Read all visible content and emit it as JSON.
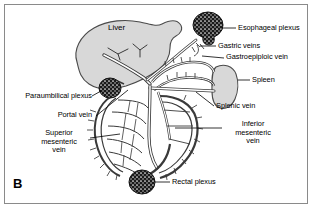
{
  "figure": {
    "panel_letter": "B",
    "type": "anatomical-diagram",
    "background_color": "#ffffff",
    "frame_color": "#8a8a8a",
    "organ_fill": "#d8d8d8",
    "vessel_fill": "#ffffff",
    "vessel_stroke": "#333333",
    "plexus_color": "#1a1a1a"
  },
  "organs": [
    {
      "name": "liver",
      "label": "Liver"
    },
    {
      "name": "spleen",
      "label": "Spleen"
    }
  ],
  "plexuses": [
    {
      "name": "esophageal-plexus",
      "label": "Esophageal plexus"
    },
    {
      "name": "paraumbilical-plexus",
      "label": "Paraumbilical plexus"
    },
    {
      "name": "rectal-plexus",
      "label": "Rectal plexus"
    }
  ],
  "labels": {
    "liver": "Liver",
    "esophageal_plexus": "Esophageal plexus",
    "gastric_veins": "Gastric veins",
    "gastroepiploic_vein": "Gastroepiploic vein",
    "spleen": "Spleen",
    "splenic_vein": "Splenic vein",
    "inferior_mesenteric_vein": "Inferior\nmesenteric\nvein",
    "inferior_mesenteric_vein_l1": "Inferior",
    "inferior_mesenteric_vein_l2": "mesenteric",
    "inferior_mesenteric_vein_l3": "vein",
    "rectal_plexus": "Rectal plexus",
    "paraumbilical_plexus": "Paraumbilical plexus",
    "portal_vein": "Portal vein",
    "superior_mesenteric_vein_l1": "Superior",
    "superior_mesenteric_vein_l2": "mesenteric",
    "superior_mesenteric_vein_l3": "vein"
  }
}
